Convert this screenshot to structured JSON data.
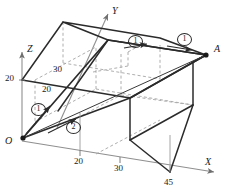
{
  "figure": {
    "type": "3d-prism-diagram",
    "colors": {
      "solid_line": "#2b2b2b",
      "dashed_line": "#9a9a9a",
      "axis_line": "#8f8f8f",
      "path_line": "#2b2b2b",
      "text": "#1a1a1a",
      "background": "#ffffff"
    },
    "axes": [
      {
        "id": "x-axis",
        "label": "X",
        "label_x": 205,
        "label_y": 163
      },
      {
        "id": "y-axis",
        "label": "Y",
        "label_x": 112,
        "label_y": 10
      },
      {
        "id": "z-axis",
        "label": "Z",
        "label_x": 27,
        "label_y": 48
      }
    ],
    "points": [
      {
        "id": "origin",
        "label": "O",
        "label_x": 5,
        "label_y": 141
      },
      {
        "id": "point-a",
        "label": "A",
        "label_x": 214,
        "label_y": 48
      }
    ],
    "dimensions": [
      {
        "id": "dim-z-20",
        "value": "20",
        "x": 5,
        "y": 72
      },
      {
        "id": "dim-top-30",
        "value": "30",
        "x": 53,
        "y": 69
      },
      {
        "id": "dim-top-20",
        "value": "20",
        "x": 42,
        "y": 88
      },
      {
        "id": "dim-base-20",
        "value": "20",
        "x": 80,
        "y": 160
      },
      {
        "id": "dim-base-30",
        "value": "30",
        "x": 119,
        "y": 166
      },
      {
        "id": "dim-base-45",
        "value": "45",
        "x": 167,
        "y": 179
      }
    ],
    "path_markers": [
      {
        "id": "marker-1-origin",
        "label": "1",
        "x": 31,
        "y": 108
      },
      {
        "id": "marker-2-origin",
        "label": "2",
        "x": 66,
        "y": 126
      },
      {
        "id": "marker-1-top",
        "label": "1",
        "x": 128,
        "y": 40
      },
      {
        "id": "marker-1-right",
        "label": "1",
        "x": 177,
        "y": 38
      }
    ]
  }
}
